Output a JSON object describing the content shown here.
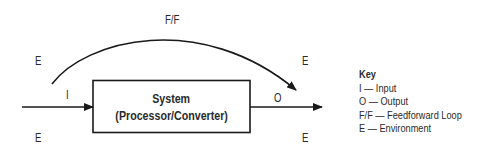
{
  "diagram": {
    "system_box": {
      "line1": "System",
      "line2": "(Processor/Converter)"
    },
    "labels": {
      "input": "I",
      "output": "O",
      "feedforward": "F/F",
      "env_top_left": "E",
      "env_bottom_left": "E",
      "env_top_right": "E",
      "env_bottom_right": "E"
    },
    "key": {
      "title": "Key",
      "items": [
        "I — Input",
        "O — Output",
        "F/F — Feedforward Loop",
        "E — Environment"
      ]
    },
    "colors": {
      "line": "#1a1a1a",
      "text": "#2a2a2a",
      "background": "#ffffff"
    }
  }
}
